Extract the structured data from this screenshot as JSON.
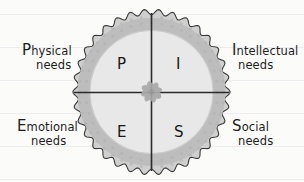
{
  "diagram": {
    "type": "quadrant-circle",
    "background_color": "#fbfbfa",
    "ring_color": "#b9b9b9",
    "inner_fill": "#e6e6e6",
    "line_color": "#2b2b2b",
    "center_icon": "flower-asterisk-icon",
    "center_icon_color": "#a8a8a8",
    "ruled_line_color": "#ededef",
    "ruled_line_positions": [
      14,
      47,
      80,
      113,
      146,
      179
    ]
  },
  "quadrants": [
    {
      "letter": "P",
      "position": "top-left",
      "label_cap": "P",
      "label_rest": "hysical",
      "label_line2": "needs"
    },
    {
      "letter": "I",
      "position": "top-right",
      "label_cap": "I",
      "label_rest": "ntellectual",
      "label_line2": "needs"
    },
    {
      "letter": "E",
      "position": "bottom-left",
      "label_cap": "E",
      "label_rest": "motional",
      "label_line2": "needs"
    },
    {
      "letter": "S",
      "position": "bottom-right",
      "label_cap": "S",
      "label_rest": "ocial",
      "label_line2": "needs"
    }
  ]
}
